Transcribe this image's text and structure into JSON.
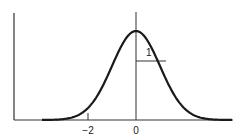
{
  "chart_data": {
    "type": "line",
    "title": "",
    "xlabel": "",
    "ylabel": "",
    "x_ticks": [
      -2,
      0
    ],
    "tick_labels": [
      "−2",
      "0"
    ],
    "series": [
      {
        "name": "normal density",
        "mean": 0,
        "sd": 1
      }
    ],
    "annotations": [
      {
        "text": "1",
        "meaning": "standard deviation width marked by horizontal segment at inflection point"
      }
    ],
    "grid": false,
    "legend": "none"
  },
  "labels": {
    "tick_neg2": "−2",
    "tick_0": "0",
    "sd_label": "1"
  },
  "colors": {
    "curve": "#1a1a1a",
    "axis": "#333333"
  }
}
